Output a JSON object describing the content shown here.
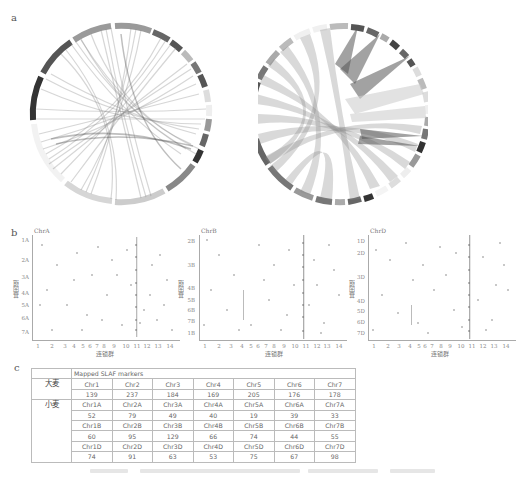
{
  "panels": {
    "a": {
      "label": "a",
      "left_circos": {
        "name": "barley-wheat-synteny-circos",
        "segment_labels": [
          "Chr1",
          "Chr2",
          "Chr3",
          "Chr4",
          "Chr5",
          "Chr6",
          "Chr7",
          "Chr1A",
          "Chr2A",
          "Chr3A",
          "Chr4A",
          "Chr5A",
          "Chr6A",
          "Chr7A"
        ]
      },
      "right_circos": {
        "name": "wheat-subgenome-synteny-circos",
        "segment_labels": [
          "Chr1A",
          "Chr1B",
          "Chr1D",
          "Chr2A",
          "Chr2B",
          "Chr2D",
          "Chr3A",
          "Chr3B",
          "Chr3D",
          "Chr4A",
          "Chr4B",
          "Chr4D",
          "Chr5A",
          "Chr5B",
          "Chr5D",
          "Chr6A",
          "Chr6B",
          "Chr6D",
          "Chr7A",
          "Chr7B",
          "Chr7D"
        ]
      }
    },
    "b": {
      "label": "b",
      "x_axis_title": "连锁群",
      "y_axis_title": "基因组",
      "x_ticks": [
        "1",
        "2",
        "3",
        "4",
        "5",
        "6",
        "7",
        "8",
        "9",
        "10",
        "11",
        "12",
        "13",
        "14"
      ],
      "plots": [
        {
          "title": "ChrA",
          "y_ticks": [
            "1A",
            "2A",
            "3A",
            "4A",
            "5A",
            "6A",
            "7A"
          ]
        },
        {
          "title": "ChrB",
          "y_ticks": [
            "2B",
            "3B",
            "4B",
            "5B",
            "6B",
            "7B",
            "1B"
          ]
        },
        {
          "title": "ChrD",
          "y_ticks": [
            "1D",
            "2D",
            "3D",
            "4D",
            "5D",
            "6D",
            "7D"
          ]
        }
      ]
    },
    "c": {
      "label": "c",
      "table": {
        "header": "Mapped SLAF markers",
        "barley_label": "大麦",
        "wheat_label": "小麦",
        "barley": {
          "chr": [
            "Chr1",
            "Chr2",
            "Chr3",
            "Chr4",
            "Chr5",
            "Chr6",
            "Chr7"
          ],
          "counts": [
            "139",
            "237",
            "184",
            "169",
            "205",
            "176",
            "178"
          ]
        },
        "wheat_A": {
          "chr": [
            "Chr1A",
            "Chr2A",
            "Chr3A",
            "Chr4A",
            "Chr5A",
            "Chr6A",
            "Chr7A"
          ],
          "counts": [
            "52",
            "79",
            "49",
            "40",
            "19",
            "39",
            "33"
          ]
        },
        "wheat_B": {
          "chr": [
            "Chr1B",
            "Chr2B",
            "Chr3B",
            "Chr4B",
            "Chr5B",
            "Chr6B",
            "Chr7B"
          ],
          "counts": [
            "60",
            "95",
            "129",
            "66",
            "74",
            "44",
            "55"
          ]
        },
        "wheat_D": {
          "chr": [
            "Chr1D",
            "Chr2D",
            "Chr3D",
            "Chr4D",
            "Chr5D",
            "Chr6D",
            "Chr7D"
          ],
          "counts": [
            "74",
            "91",
            "63",
            "53",
            "75",
            "67",
            "98"
          ]
        }
      }
    }
  },
  "colors": {
    "ring_dark": "#555555",
    "ring_mid": "#8a8a8a",
    "ring_light": "#c8c8c8",
    "link": "#9a9a9a",
    "dot": "#666666",
    "table_border": "#bbbbbb"
  }
}
